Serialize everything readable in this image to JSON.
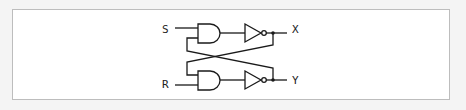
{
  "diagram": {
    "type": "SR latch (cross-coupled AND + NOT gates)",
    "inputs": [
      {
        "label": "S"
      },
      {
        "label": "R"
      }
    ],
    "outputs": [
      {
        "label": "X"
      },
      {
        "label": "Y"
      }
    ],
    "gates": [
      {
        "id": "and_top",
        "type": "AND"
      },
      {
        "id": "not_top",
        "type": "NOT"
      },
      {
        "id": "and_bottom",
        "type": "AND"
      },
      {
        "id": "not_bottom",
        "type": "NOT"
      }
    ],
    "colors": {
      "line": "#1a1a1a",
      "frame_border": "#bdbdbd",
      "background": "#ffffff"
    }
  }
}
